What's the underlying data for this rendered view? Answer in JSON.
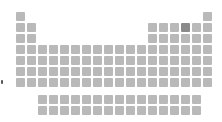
{
  "table": {
    "name": "periodic-table",
    "cell_color": "#b9b9b9",
    "highlight_color": "#8a8a8a",
    "highlighted": {
      "period": 2,
      "group": 16
    },
    "main_layout": [
      [
        1,
        18
      ],
      [
        1,
        2,
        13,
        14,
        15,
        16,
        17,
        18
      ],
      [
        1,
        2,
        13,
        14,
        15,
        16,
        17,
        18
      ],
      [
        1,
        2,
        3,
        4,
        5,
        6,
        7,
        8,
        9,
        10,
        11,
        12,
        13,
        14,
        15,
        16,
        17,
        18
      ],
      [
        1,
        2,
        3,
        4,
        5,
        6,
        7,
        8,
        9,
        10,
        11,
        12,
        13,
        14,
        15,
        16,
        17,
        18
      ],
      [
        1,
        2,
        3,
        4,
        5,
        6,
        7,
        8,
        9,
        10,
        11,
        12,
        13,
        14,
        15,
        16,
        17,
        18
      ],
      [
        1,
        2,
        3,
        4,
        5,
        6,
        7,
        8,
        9,
        10,
        11,
        12,
        13,
        14,
        15,
        16,
        17,
        18
      ]
    ],
    "f_block_rows": 2,
    "f_block_cols": 15
  }
}
